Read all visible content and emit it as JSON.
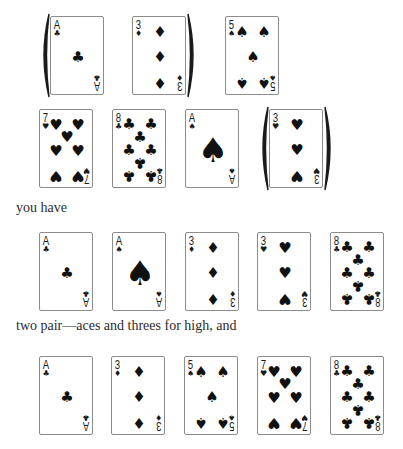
{
  "colors": {
    "ink": "#111111",
    "border": "#8c8c8c",
    "text": "#2b2b2b"
  },
  "rows": [
    {
      "top": 16,
      "cards": [
        {
          "rank": "A",
          "suit": "clubs",
          "glyph": "♣",
          "left": 50
        },
        {
          "rank": "3",
          "suit": "diamonds",
          "glyph": "♦",
          "left": 132
        },
        {
          "rank": "5",
          "suit": "spades",
          "glyph": "♠",
          "left": 225
        }
      ],
      "brackets": [
        {
          "from": 0,
          "to": 1
        }
      ]
    },
    {
      "top": 109,
      "cards": [
        {
          "rank": "7",
          "suit": "hearts",
          "glyph": "♥",
          "left": 39
        },
        {
          "rank": "8",
          "suit": "clubs",
          "glyph": "♣",
          "left": 112
        },
        {
          "rank": "A",
          "suit": "spades",
          "glyph": "♠",
          "left": 185
        },
        {
          "rank": "3",
          "suit": "hearts",
          "glyph": "♥",
          "left": 269
        }
      ],
      "brackets": [
        {
          "from": 3,
          "to": 3
        }
      ]
    },
    {
      "top": 232,
      "cards": [
        {
          "rank": "A",
          "suit": "clubs",
          "glyph": "♣",
          "left": 39
        },
        {
          "rank": "A",
          "suit": "spades",
          "glyph": "♠",
          "left": 112
        },
        {
          "rank": "3",
          "suit": "diamonds",
          "glyph": "♦",
          "left": 185
        },
        {
          "rank": "3",
          "suit": "hearts",
          "glyph": "♥",
          "left": 257
        },
        {
          "rank": "8",
          "suit": "clubs",
          "glyph": "♣",
          "left": 330
        }
      ],
      "brackets": []
    },
    {
      "top": 356,
      "cards": [
        {
          "rank": "A",
          "suit": "clubs",
          "glyph": "♣",
          "left": 39
        },
        {
          "rank": "3",
          "suit": "diamonds",
          "glyph": "♦",
          "left": 111
        },
        {
          "rank": "5",
          "suit": "spades",
          "glyph": "♠",
          "left": 184
        },
        {
          "rank": "7",
          "suit": "hearts",
          "glyph": "♥",
          "left": 257
        },
        {
          "rank": "8",
          "suit": "clubs",
          "glyph": "♣",
          "left": 330
        }
      ],
      "brackets": []
    }
  ],
  "text": {
    "line1": "you have",
    "line2": "two pair—aces and threes for high, and"
  }
}
